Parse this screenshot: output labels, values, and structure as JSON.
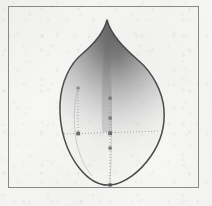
{
  "figure": {
    "kind": "scanned-technical-figure",
    "title": "",
    "caption": "",
    "background_color": "#f6f6f5",
    "frame": {
      "name": "figure-border-frame",
      "stroke_color": "#8a8a8a",
      "stroke_width": 1,
      "x": 8,
      "y": 6,
      "width": 191,
      "height": 182
    },
    "shape": {
      "name": "teardrop-cusp-outline",
      "description": "closed teardrop / petal outline with a sharp cusp at top and rounded base",
      "stroke_color": "#4a4a4a",
      "stroke_width": 1.5,
      "cusp_apex": {
        "x": 107,
        "y": 20
      },
      "bottom_point": {
        "x": 110,
        "y": 185
      },
      "left_extreme": {
        "x": 60,
        "y": 120
      },
      "right_extreme": {
        "x": 164,
        "y": 112
      },
      "path": "M 107 20 C 104 32 94 44 82 54 C 70 64 61 82 60 104 C 59 128 66 152 80 169 C 90 181 100 186 110 185 C 124 184 140 172 151 156 C 162 140 165 124 164 110 C 163 92 152 72 139 61 C 124 48 111 35 107 20 Z"
    },
    "shading": {
      "name": "interior-gradient-fill",
      "description": "dark grey tone concentrated at the cusp, fading to near-white toward the base",
      "dark_color": "#6e6e6e",
      "mid_color": "#b4b4b4",
      "light_color": "#f2f2f1",
      "focus_x_pct": 52,
      "focus_y_pct": 12
    },
    "construction": {
      "name": "control-polygon",
      "line_style": "dotted",
      "line_color": "#9a9a9a",
      "point_color": "#787878",
      "point_size": 3,
      "vertical_axis": {
        "x": 110,
        "y_top": 70,
        "y_bottom": 185
      },
      "horizontal_axis": {
        "y": 133,
        "x_left": 64,
        "x_right": 160
      },
      "secondary_vertical": {
        "x": 78,
        "y_top": 88,
        "y_bottom": 133
      },
      "points": [
        {
          "name": "cp-axis-upper",
          "x": 110,
          "y": 98
        },
        {
          "name": "cp-axis-mid",
          "x": 110,
          "y": 118
        },
        {
          "name": "cp-axis-center",
          "x": 110,
          "y": 133
        },
        {
          "name": "cp-axis-lower",
          "x": 110,
          "y": 148
        },
        {
          "name": "cp-axis-base",
          "x": 110,
          "y": 185
        },
        {
          "name": "cp-left-waist",
          "x": 78,
          "y": 133
        },
        {
          "name": "cp-left-upper",
          "x": 78,
          "y": 88
        }
      ],
      "faint_curves": [
        {
          "name": "inner-left-guide",
          "path": "M 78 88 C 72 112 71 150 92 176"
        },
        {
          "name": "inner-right-guide",
          "path": "M 110 70 C 112 100 112 150 110 185"
        }
      ]
    }
  }
}
